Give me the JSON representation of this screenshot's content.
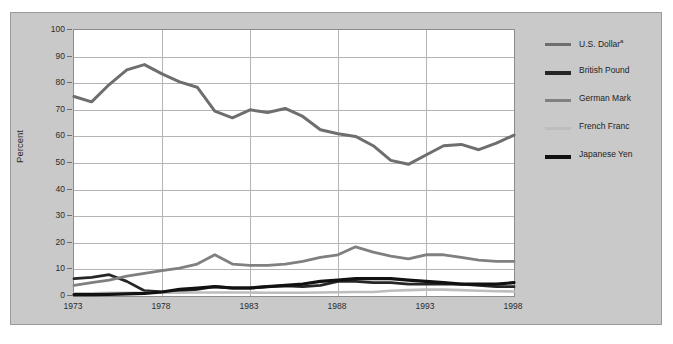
{
  "chart_data": {
    "type": "line",
    "title": "",
    "xlabel": "",
    "ylabel": "Percent",
    "xlim": [
      1973,
      1998
    ],
    "ylim": [
      0,
      100
    ],
    "grid": true,
    "legend_position": "right",
    "x": [
      1973,
      1974,
      1975,
      1976,
      1977,
      1978,
      1979,
      1980,
      1981,
      1982,
      1983,
      1984,
      1985,
      1986,
      1987,
      1988,
      1989,
      1990,
      1991,
      1992,
      1993,
      1994,
      1995,
      1996,
      1997,
      1998
    ],
    "xticks": [
      "1973",
      "1978",
      "1983",
      "1988",
      "1993",
      "1998"
    ],
    "yticks": [
      "0",
      "10",
      "20",
      "30",
      "40",
      "50",
      "60",
      "70",
      "80",
      "90",
      "100"
    ],
    "series": [
      {
        "name": "U.S. Dollar",
        "footnote_marker": "a",
        "color": "#6e6e6e",
        "width": 3.0,
        "values": [
          75.0,
          73.0,
          79.5,
          85.0,
          87.0,
          83.5,
          80.5,
          78.5,
          69.5,
          67.0,
          70.0,
          69.0,
          70.5,
          67.5,
          62.5,
          61.0,
          60.0,
          56.5,
          51.0,
          49.5,
          53.0,
          56.5,
          57.0,
          55.0,
          57.5,
          60.5
        ]
      },
      {
        "name": "British Pound",
        "color": "#262626",
        "width": 2.8,
        "values": [
          6.5,
          7.0,
          8.0,
          5.5,
          2.0,
          1.5,
          1.8,
          2.5,
          3.5,
          3.0,
          3.0,
          3.5,
          3.8,
          3.5,
          4.0,
          5.5,
          5.5,
          5.0,
          5.0,
          4.5,
          4.5,
          4.5,
          4.5,
          4.0,
          3.5,
          3.5
        ]
      },
      {
        "name": "German Mark",
        "color": "#808080",
        "width": 2.8,
        "values": [
          4.0,
          5.0,
          6.0,
          7.5,
          8.5,
          9.5,
          10.5,
          12.0,
          15.5,
          12.0,
          11.5,
          11.5,
          12.0,
          13.0,
          14.5,
          15.5,
          18.5,
          16.5,
          15.0,
          14.0,
          15.5,
          15.5,
          14.5,
          13.5,
          13.0,
          13.0
        ]
      },
      {
        "name": "French Franc",
        "color": "#bdbdbd",
        "width": 2.6,
        "values": [
          1.0,
          1.0,
          1.2,
          1.2,
          1.2,
          1.2,
          1.2,
          1.3,
          1.3,
          1.3,
          1.3,
          1.2,
          1.2,
          1.2,
          1.3,
          1.4,
          1.5,
          1.5,
          2.0,
          2.2,
          2.4,
          2.4,
          2.2,
          2.0,
          1.8,
          1.7
        ]
      },
      {
        "name": "Japanese Yen",
        "color": "#111111",
        "width": 3.2,
        "values": [
          0.5,
          0.5,
          0.6,
          0.8,
          1.0,
          1.5,
          2.5,
          3.0,
          3.5,
          3.0,
          3.0,
          3.5,
          4.0,
          4.5,
          5.5,
          6.0,
          6.5,
          6.5,
          6.5,
          6.0,
          5.5,
          5.0,
          4.5,
          4.5,
          4.5,
          5.0
        ]
      }
    ]
  },
  "axis": {
    "ylabel": "Percent",
    "yticks": [
      "100",
      "90",
      "80",
      "70",
      "60",
      "50",
      "40",
      "30",
      "20",
      "10",
      "0"
    ],
    "xticks": [
      "1973",
      "1978",
      "1983",
      "1988",
      "1993",
      "1998"
    ]
  },
  "legend": {
    "items": [
      {
        "label": "U.S. Dollar",
        "sup": "a",
        "color": "#6e6e6e",
        "thickness": "3px"
      },
      {
        "label": "British Pound",
        "sup": "",
        "color": "#262626",
        "thickness": "4px"
      },
      {
        "label": "German Mark",
        "sup": "",
        "color": "#808080",
        "thickness": "3px"
      },
      {
        "label": "French Franc",
        "sup": "",
        "color": "#bdbdbd",
        "thickness": "3px"
      },
      {
        "label": "Japanese Yen",
        "sup": "",
        "color": "#111111",
        "thickness": "4px"
      }
    ]
  },
  "colors": {
    "panel_background": "#c9c9c9",
    "plot_background": "#ffffff",
    "gridline": "#b4b4b4",
    "text": "#2b2b2b"
  },
  "footnote": {
    "text": ""
  }
}
